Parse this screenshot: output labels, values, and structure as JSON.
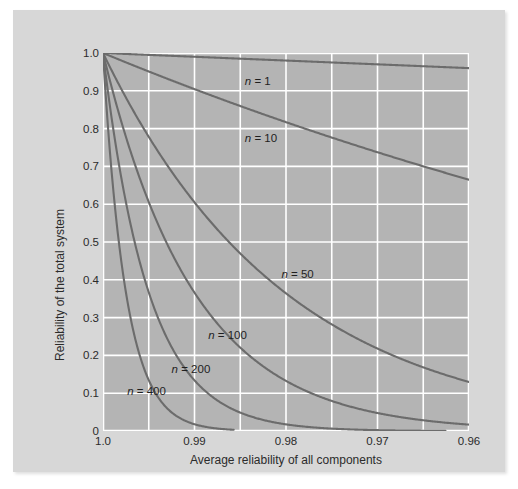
{
  "chart_data": {
    "type": "line",
    "title": "",
    "xlabel": "Average reliability of all components",
    "ylabel": "Reliability of the total system",
    "xlim": [
      1.0,
      0.96
    ],
    "ylim": [
      0.0,
      1.0
    ],
    "x_reversed": true,
    "grid": true,
    "legend_position": "inline-annotations",
    "x_ticks": [
      "1.0",
      "0.99",
      "0.98",
      "0.97",
      "0.96"
    ],
    "x_tick_values": [
      1.0,
      0.99,
      0.98,
      0.97,
      0.96
    ],
    "x_gridline_values": [
      1.0,
      0.995,
      0.99,
      0.985,
      0.98,
      0.975,
      0.97,
      0.965,
      0.96
    ],
    "y_ticks": [
      "0",
      "0.1",
      "0.2",
      "0.3",
      "0.4",
      "0.5",
      "0.6",
      "0.7",
      "0.8",
      "0.9",
      "1.0"
    ],
    "y_tick_values": [
      0,
      0.1,
      0.2,
      0.3,
      0.4,
      0.5,
      0.6,
      0.7,
      0.8,
      0.9,
      1.0
    ],
    "formula": "R = r^n",
    "plot_background": "#b4b4b4",
    "gridline_color": "#ffffff",
    "curve_color": "#6c6c6c",
    "panel_background": "#d7d7d7",
    "series": [
      {
        "name": "n = 1",
        "n": 1,
        "label_x": 0.9845,
        "label_y": 0.925,
        "x": [
          1.0,
          0.995,
          0.99,
          0.985,
          0.98,
          0.975,
          0.97,
          0.965,
          0.96
        ],
        "values": [
          1.0,
          0.995,
          0.99,
          0.985,
          0.98,
          0.975,
          0.97,
          0.965,
          0.96
        ]
      },
      {
        "name": "n = 10",
        "n": 10,
        "label_x": 0.9845,
        "label_y": 0.775,
        "x": [
          1.0,
          0.995,
          0.99,
          0.985,
          0.98,
          0.975,
          0.97,
          0.965,
          0.96
        ],
        "values": [
          1.0,
          0.951,
          0.904,
          0.86,
          0.817,
          0.776,
          0.737,
          0.7,
          0.665
        ]
      },
      {
        "name": "n = 50",
        "n": 50,
        "label_x": 0.9805,
        "label_y": 0.415,
        "x": [
          1.0,
          0.995,
          0.99,
          0.985,
          0.98,
          0.975,
          0.97,
          0.965,
          0.96
        ],
        "values": [
          1.0,
          0.778,
          0.605,
          0.47,
          0.364,
          0.282,
          0.218,
          0.167,
          0.13
        ]
      },
      {
        "name": "n = 100",
        "n": 100,
        "label_x": 0.9885,
        "label_y": 0.255,
        "x": [
          1.0,
          0.995,
          0.99,
          0.985,
          0.98,
          0.975,
          0.97,
          0.965,
          0.96
        ],
        "values": [
          1.0,
          0.606,
          0.366,
          0.221,
          0.133,
          0.0795,
          0.0476,
          0.0279,
          0.0169
        ]
      },
      {
        "name": "n = 200",
        "n": 200,
        "label_x": 0.9925,
        "label_y": 0.165,
        "x": [
          1.0,
          0.995,
          0.99,
          0.985,
          0.98,
          0.975,
          0.97,
          0.965,
          0.96
        ],
        "values": [
          1.0,
          0.367,
          0.134,
          0.0489,
          0.0176,
          0.0063,
          0.0023,
          0.0008,
          0.0003
        ]
      },
      {
        "name": "n = 400",
        "n": 400,
        "label_x": 0.99735,
        "label_y": 0.105,
        "x": [
          1.0,
          0.995,
          0.99,
          0.985,
          0.98,
          0.975,
          0.97,
          0.965,
          0.96
        ],
        "values": [
          1.0,
          0.134,
          0.018,
          0.0024,
          0.0003,
          4e-05,
          0.0,
          0.0,
          0.0
        ]
      }
    ],
    "annotations": [
      {
        "text": "n = 1"
      },
      {
        "text": "n = 10"
      },
      {
        "text": "n = 50"
      },
      {
        "text": "n = 100"
      },
      {
        "text": "n = 200"
      },
      {
        "text": "n = 400"
      }
    ]
  }
}
